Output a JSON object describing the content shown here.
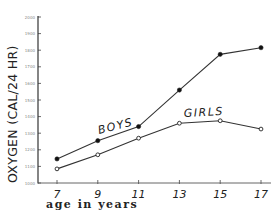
{
  "chart_data": {
    "type": "line",
    "title": "",
    "xlabel": "age in years",
    "ylabel": "OXYGEN (CAL/24 HR)",
    "x": [
      7,
      9,
      11,
      13,
      15,
      17
    ],
    "x_tick_labels": [
      "7",
      "9",
      "11",
      "13",
      "15",
      "17"
    ],
    "y_tick_labels": [
      "1000",
      "1100",
      "1200",
      "1300",
      "1400",
      "1500",
      "1600",
      "1700",
      "1800",
      "1900",
      "2000"
    ],
    "ylim": [
      1000,
      2000
    ],
    "grid": false,
    "legend": "inline labels",
    "series": [
      {
        "name": "BOYS",
        "marker": "filled-circle",
        "values": [
          1145,
          1255,
          1340,
          1560,
          1775,
          1815
        ]
      },
      {
        "name": "GIRLS",
        "marker": "open-circle",
        "values": [
          1085,
          1170,
          1270,
          1360,
          1375,
          1325
        ]
      }
    ]
  },
  "colors": {
    "line": "#333333",
    "axis": "#333333",
    "background": "#ffffff"
  }
}
